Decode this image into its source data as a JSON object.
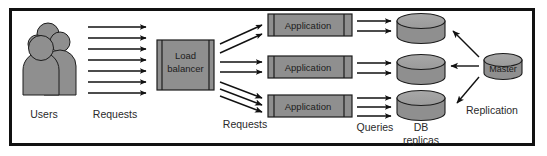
{
  "diagram": {
    "colors": {
      "shape_fill": "#8f8f8f",
      "shape_fill_light": "#9a9a9a",
      "shape_stroke": "#1c1c1c",
      "arrow": "#111111",
      "frame": "#111111",
      "background": "#ffffff",
      "text": "#2a2a2a"
    },
    "frame": {
      "label": "diagram-border"
    },
    "nodes": {
      "users": {
        "icon": "users-group-icon",
        "label": "Users"
      },
      "load_balancer": {
        "icon": "server-rack-icon",
        "label": "Load\nbalancer",
        "line1": "Load",
        "line2": "balancer"
      },
      "applications": [
        {
          "icon": "server-rack-icon",
          "label": "Application"
        },
        {
          "icon": "server-rack-icon",
          "label": "Application"
        },
        {
          "icon": "server-rack-icon",
          "label": "Application"
        }
      ],
      "db_replicas": [
        {
          "icon": "database-cylinder-icon",
          "label": ""
        },
        {
          "icon": "database-cylinder-icon",
          "label": ""
        },
        {
          "icon": "database-cylinder-icon",
          "label": ""
        }
      ],
      "db_replicas_caption": {
        "line1": "DB",
        "line2": "replicas"
      },
      "master": {
        "icon": "database-cylinder-icon",
        "label": "Master"
      }
    },
    "edge_labels": {
      "requests_users": "Requests",
      "requests_lb": "Requests",
      "queries": "Queries",
      "replication": "Replication"
    },
    "edges": {
      "users_to_lb": {
        "count": 7,
        "style": "horizontal-arrow"
      },
      "lb_to_app_top": {
        "count": 2,
        "style": "diagonal-up-arrow"
      },
      "lb_to_app_mid": {
        "count": 2,
        "style": "horizontal-arrow"
      },
      "lb_to_app_bottom": {
        "count": 3,
        "style": "diagonal-down-arrow"
      },
      "app_to_db_top": {
        "count": 2,
        "style": "horizontal-arrow"
      },
      "app_to_db_mid": {
        "count": 2,
        "style": "horizontal-arrow"
      },
      "app_to_db_bottom": {
        "count": 3,
        "style": "horizontal-arrow"
      },
      "master_to_replicas": {
        "count": 3,
        "style": "arrow-to-left"
      }
    }
  }
}
